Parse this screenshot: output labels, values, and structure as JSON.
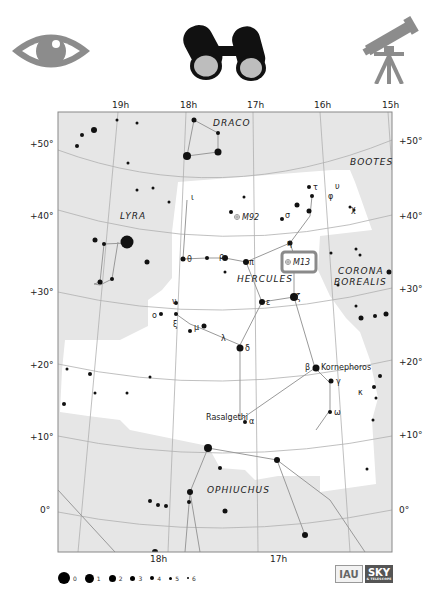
{
  "header": {
    "icons": [
      {
        "name": "naked-eye",
        "label": "eye-icon"
      },
      {
        "name": "binoculars",
        "label": "binoculars-icon"
      },
      {
        "name": "telescope",
        "label": "telescope-icon"
      }
    ]
  },
  "map": {
    "ra_labels_top": [
      "19h",
      "18h",
      "17h",
      "16h",
      "15h"
    ],
    "ra_labels_bottom": [
      "18h",
      "17h"
    ],
    "dec_labels_left": [
      "+50°",
      "+40°",
      "+30°",
      "+20°",
      "+10°",
      "0°"
    ],
    "dec_labels_right": [
      "+50°",
      "+40°",
      "+30°",
      "+20°",
      "+10°",
      "0°"
    ],
    "constellations": {
      "draco": "DRACO",
      "bootes": "BOOTES",
      "lyra": "LYRA",
      "hercules": "HERCULES",
      "corona_borealis_1": "CORONA",
      "corona_borealis_2": "BOREALIS",
      "ophiuchus": "OPHIUCHUS"
    },
    "deep_sky": {
      "m92": "M92",
      "m13": "M13"
    },
    "star_names": {
      "kornephoros": "Kornephoros",
      "rasalgethi": "Rasalgethi"
    },
    "greek": {
      "iota": "ι",
      "theta": "θ",
      "rho": "ρ",
      "pi": "π",
      "eta": "η",
      "sigma": "σ",
      "tau": "τ",
      "phi": "φ",
      "upsilon": "υ",
      "chi": "χ",
      "zeta": "ζ",
      "epsilon": "ε",
      "nu": "ν",
      "omicron": "ο",
      "xi": "ξ",
      "mu": "μ",
      "lambda": "λ",
      "delta": "δ",
      "beta": "β",
      "gamma": "γ",
      "kappa": "κ",
      "omega": "ω",
      "alpha": "α"
    },
    "highlight_color": "#8a8a8a",
    "shade_color": "#e6e6e6"
  },
  "legend": {
    "title": "magnitude",
    "items": [
      {
        "mag": "0",
        "size": 18
      },
      {
        "mag": "1",
        "size": 13
      },
      {
        "mag": "2",
        "size": 10
      },
      {
        "mag": "3",
        "size": 7
      },
      {
        "mag": "4",
        "size": 5
      },
      {
        "mag": "5",
        "size": 3.5
      },
      {
        "mag": "6",
        "size": 2.5
      }
    ]
  },
  "logos": {
    "iau": "IAU",
    "sky": "SKY",
    "sky_sub": "& TELESCOPE"
  }
}
